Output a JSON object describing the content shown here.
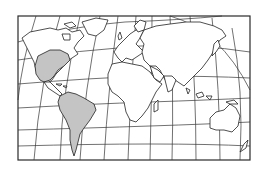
{
  "map": {
    "title": "World map with highlighted regions",
    "projection": "curved graticule world outline",
    "highlight_color": "#c4c4c4",
    "outline_color": "#222222",
    "background_color": "#ffffff",
    "highlighted_regions": [
      "United States",
      "South America"
    ],
    "continents": [
      "North America",
      "South America",
      "Europe",
      "Africa",
      "Asia",
      "Australia"
    ]
  }
}
